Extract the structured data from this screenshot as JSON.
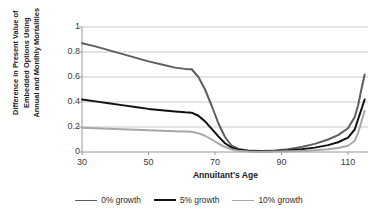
{
  "chart_data": {
    "type": "line",
    "title": "",
    "xlabel": "Annuitant's Age",
    "ylabel": "Difference in Present Value of Embedded Options Using Annual and Monthly Mortalities",
    "ylabel_lines": [
      "Difference in Present Value of",
      "Embedded Options Using",
      "Annual  and Monthly Mortalities"
    ],
    "xlim": [
      30,
      116
    ],
    "ylim": [
      0,
      1
    ],
    "xticks": [
      30,
      50,
      70,
      90,
      110
    ],
    "yticks": [
      "0",
      "0.2",
      "0.4",
      "0.6",
      "0.8",
      "1"
    ],
    "ytick_values": [
      0,
      0.2,
      0.4,
      0.6,
      0.8,
      1
    ],
    "grid": "horizontal",
    "legend_position": "bottom",
    "series": [
      {
        "name": "0% growth",
        "color": "#5e5e5e",
        "width": 2.0,
        "x": [
          30,
          34,
          38,
          42,
          46,
          50,
          54,
          58,
          61,
          63,
          65,
          67,
          69,
          71,
          73,
          75,
          77,
          80,
          84,
          88,
          92,
          96,
          100,
          104,
          107,
          110,
          112,
          113,
          114,
          115
        ],
        "y": [
          0.87,
          0.845,
          0.815,
          0.785,
          0.755,
          0.725,
          0.7,
          0.675,
          0.665,
          0.662,
          0.6,
          0.5,
          0.37,
          0.23,
          0.12,
          0.05,
          0.025,
          0.012,
          0.008,
          0.012,
          0.022,
          0.04,
          0.065,
          0.1,
          0.135,
          0.19,
          0.28,
          0.37,
          0.5,
          0.62
        ]
      },
      {
        "name": "5% growth",
        "color": "#111111",
        "width": 2.0,
        "x": [
          30,
          34,
          38,
          42,
          46,
          50,
          54,
          58,
          61,
          63,
          65,
          67,
          69,
          71,
          73,
          75,
          77,
          80,
          84,
          88,
          92,
          96,
          100,
          104,
          107,
          110,
          112,
          113,
          114,
          115
        ],
        "y": [
          0.42,
          0.405,
          0.39,
          0.375,
          0.36,
          0.345,
          0.335,
          0.325,
          0.318,
          0.315,
          0.29,
          0.245,
          0.185,
          0.125,
          0.07,
          0.035,
          0.018,
          0.009,
          0.006,
          0.008,
          0.013,
          0.022,
          0.035,
          0.055,
          0.078,
          0.115,
          0.18,
          0.26,
          0.34,
          0.42
        ]
      },
      {
        "name": "10% growth",
        "color": "#a8a8a8",
        "width": 2.0,
        "x": [
          30,
          34,
          38,
          42,
          46,
          50,
          54,
          58,
          61,
          63,
          65,
          67,
          69,
          71,
          73,
          75,
          77,
          80,
          84,
          88,
          92,
          96,
          100,
          104,
          107,
          110,
          112,
          113,
          114,
          115
        ],
        "y": [
          0.195,
          0.19,
          0.186,
          0.182,
          0.178,
          0.174,
          0.17,
          0.167,
          0.164,
          0.162,
          0.15,
          0.13,
          0.1,
          0.068,
          0.04,
          0.02,
          0.01,
          0.005,
          0.003,
          0.004,
          0.006,
          0.009,
          0.014,
          0.022,
          0.032,
          0.05,
          0.09,
          0.15,
          0.24,
          0.33
        ]
      }
    ]
  },
  "legend": {
    "items": [
      {
        "label": "0% growth",
        "color": "#5e5e5e"
      },
      {
        "label": "5% growth",
        "color": "#111111"
      },
      {
        "label": "10% growth",
        "color": "#a8a8a8"
      }
    ]
  },
  "colors": {
    "grid": "#c9c9c9",
    "axis": "#9a9a9a",
    "text": "#2b2b2b"
  }
}
